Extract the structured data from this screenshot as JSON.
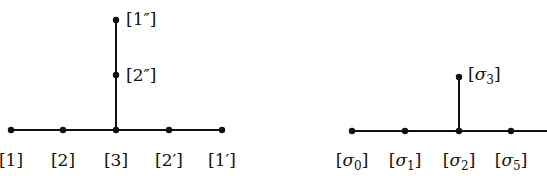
{
  "diagrams": [
    {
      "name": "dynkin-left",
      "nodes": [
        {
          "id": "1",
          "label": "[1]",
          "x": 11,
          "y": 130,
          "lx": 11,
          "ly": 165
        },
        {
          "id": "2",
          "label": "[2]",
          "x": 63,
          "y": 130,
          "lx": 63,
          "ly": 165
        },
        {
          "id": "3",
          "label": "[3]",
          "x": 116,
          "y": 130,
          "lx": 116,
          "ly": 165
        },
        {
          "id": "2p",
          "label": "[2′]",
          "x": 169,
          "y": 130,
          "lx": 169,
          "ly": 165
        },
        {
          "id": "1p",
          "label": "[1′]",
          "x": 222,
          "y": 130,
          "lx": 222,
          "ly": 165
        },
        {
          "id": "2pp",
          "label": "[2″]",
          "x": 116,
          "y": 75,
          "lx": 146,
          "ly": 76
        },
        {
          "id": "1pp",
          "label": "[1″]",
          "x": 116,
          "y": 20,
          "lx": 146,
          "ly": 20
        }
      ],
      "edges": [
        [
          "1",
          "2"
        ],
        [
          "2",
          "3"
        ],
        [
          "3",
          "2p"
        ],
        [
          "2p",
          "1p"
        ],
        [
          "3",
          "2pp"
        ],
        [
          "2pp",
          "1pp"
        ]
      ]
    },
    {
      "name": "dynkin-right",
      "nodes": [
        {
          "id": "s0",
          "label": "[σ0]",
          "x": 352,
          "y": 131,
          "lx": 352,
          "ly": 165
        },
        {
          "id": "s1",
          "label": "[σ1]",
          "x": 405,
          "y": 131,
          "lx": 405,
          "ly": 165
        },
        {
          "id": "s2",
          "label": "[σ2]",
          "x": 459,
          "y": 131,
          "lx": 459,
          "ly": 165
        },
        {
          "id": "s5",
          "label": "[σ5]",
          "x": 511,
          "y": 131,
          "lx": 511,
          "ly": 165
        },
        {
          "id": "s3",
          "label": "[σ3]",
          "x": 459,
          "y": 77,
          "lx": 488,
          "ly": 78
        }
      ],
      "edges": [
        [
          "s0",
          "s1"
        ],
        [
          "s1",
          "s2"
        ],
        [
          "s2",
          "s5"
        ],
        [
          "s2",
          "s3"
        ]
      ],
      "open_edge": {
        "from": "s5",
        "to_x": 547,
        "to_y": 131
      }
    }
  ],
  "labels": {
    "l1": "[1]",
    "l2": "[2]",
    "l3": "[3]",
    "l2p": "[2′]",
    "l1p": "[1′]",
    "l2pp": "[2″]",
    "l1pp": "[1″]",
    "s0": "σ",
    "s0sub": "0",
    "s1": "σ",
    "s1sub": "1",
    "s2": "σ",
    "s2sub": "2",
    "s5": "σ",
    "s5sub": "5",
    "s3": "σ",
    "s3sub": "3",
    "lb": "[",
    "rb": "]"
  }
}
